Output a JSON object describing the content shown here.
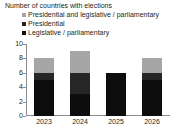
{
  "chart_data": {
    "type": "bar",
    "subtype": "stacked-vertical",
    "title": "Number of countries with elections",
    "xlabel": "",
    "ylabel": "",
    "categories": [
      "2023",
      "2024",
      "2025",
      "2026"
    ],
    "yticks": [
      0,
      2,
      4,
      6,
      8,
      10
    ],
    "ylim": [
      0,
      10
    ],
    "grid": false,
    "legend_position": "top-left",
    "series": [
      {
        "name": "Presidential and legislative / parliamentary",
        "color": "#a6a6a6",
        "values": [
          2,
          3,
          0,
          2
        ]
      },
      {
        "name": "Presidential",
        "color": "#262626",
        "values": [
          1,
          3,
          0,
          1
        ]
      },
      {
        "name": "Legislative / parliamentary",
        "color": "#0d0d0d",
        "values": [
          5,
          3,
          6,
          5
        ]
      }
    ],
    "totals": [
      8,
      9,
      6,
      8
    ]
  },
  "axis": {
    "tick_labels": [
      "10",
      "8",
      "6",
      "4",
      "2",
      "0"
    ],
    "category_labels": [
      "2023",
      "2024",
      "2025",
      "2026"
    ]
  },
  "legend": {
    "items": [
      {
        "label": "Presidential and legislative / parliamentary",
        "marker": "square-swatch"
      },
      {
        "label": "Presidential",
        "marker": "square-swatch"
      },
      {
        "label": "Legislative / parliamentary",
        "marker": "square-swatch"
      }
    ]
  },
  "colors": {
    "axis": "#8a8a8a",
    "text": "#231f20",
    "background": "#ffffff"
  }
}
